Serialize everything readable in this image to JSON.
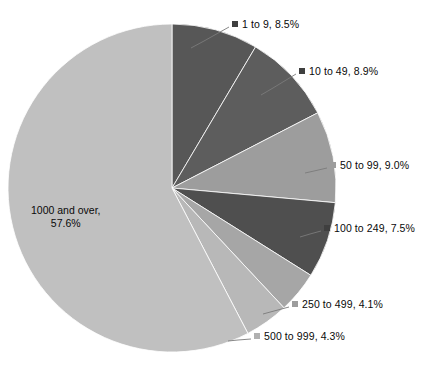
{
  "chart_data": {
    "type": "pie",
    "title": "",
    "legend_position": "callout-labels",
    "categories": [
      "1 to 9",
      "10 to 49",
      "50 to 99",
      "100 to 249",
      "250 to 499",
      "500 to 999",
      "1000 and over"
    ],
    "values": [
      8.5,
      8.9,
      9.0,
      7.5,
      4.1,
      4.3,
      57.6
    ],
    "value_unit": "%",
    "start_angle_deg": 0,
    "direction": "clockwise",
    "center": {
      "x": 172,
      "y": 188
    },
    "radius": 164,
    "colors": [
      "#575757",
      "#5d5d5d",
      "#9d9d9d",
      "#4f4f4f",
      "#a6a6a6",
      "#b8b8b8",
      "#c0c0c0"
    ],
    "slices": [
      {
        "label": "1 to 9, 8.5%",
        "name": "1 to 9",
        "value": 8.5,
        "color": "#575757",
        "marker_color": "#3f3f3f",
        "label_placement": "callout",
        "label_x": 232,
        "label_y": 18,
        "leader": {
          "x1": 229,
          "y1": 27,
          "x2": 204,
          "y2": 41,
          "x3": 191,
          "y3": 48
        }
      },
      {
        "label": "10 to 49, 8.9%",
        "name": "10 to 49",
        "value": 8.9,
        "color": "#5d5d5d",
        "marker_color": "#3f3f3f",
        "label_placement": "callout",
        "label_x": 299,
        "label_y": 65,
        "leader": {
          "x1": 296,
          "y1": 74,
          "x2": 273,
          "y2": 88,
          "x3": 261,
          "y3": 95
        }
      },
      {
        "label": "50 to 99, 9.0%",
        "name": "50 to 99",
        "value": 9.0,
        "color": "#9d9d9d",
        "marker_color": "#9d9d9d",
        "label_placement": "callout",
        "label_x": 330,
        "label_y": 159,
        "leader": {
          "x1": 327,
          "y1": 168,
          "x2": 314,
          "y2": 171,
          "x3": 305,
          "y3": 173
        }
      },
      {
        "label": "100 to 249, 7.5%",
        "name": "100 to 249",
        "value": 7.5,
        "color": "#4f4f4f",
        "marker_color": "#3f3f3f",
        "label_placement": "callout",
        "label_x": 324,
        "label_y": 222,
        "leader": {
          "x1": 321,
          "y1": 231,
          "x2": 310,
          "y2": 234,
          "x3": 300,
          "y3": 237
        }
      },
      {
        "label": "250 to 499, 4.1%",
        "name": "250 to 499",
        "value": 4.1,
        "color": "#a6a6a6",
        "marker_color": "#9d9d9d",
        "label_placement": "callout",
        "label_x": 292,
        "label_y": 298,
        "leader": {
          "x1": 289,
          "y1": 307,
          "x2": 274,
          "y2": 311,
          "x3": 263,
          "y3": 314
        }
      },
      {
        "label": "500 to 999, 4.3%",
        "name": "500 to 999",
        "value": 4.3,
        "color": "#b8b8b8",
        "marker_color": "#b0b0b0",
        "label_placement": "callout",
        "label_x": 254,
        "label_y": 330,
        "leader": {
          "x1": 251,
          "y1": 339,
          "x2": 238,
          "y2": 340,
          "x3": 228,
          "y3": 341
        }
      },
      {
        "label_line_1": "1000 and over,",
        "label_line_2": "57.6%",
        "name": "1000 and over",
        "value": 57.6,
        "color": "#c0c0c0",
        "marker_color": "#c0c0c0",
        "label_placement": "inside",
        "label_x": 31,
        "label_y": 204
      }
    ]
  }
}
